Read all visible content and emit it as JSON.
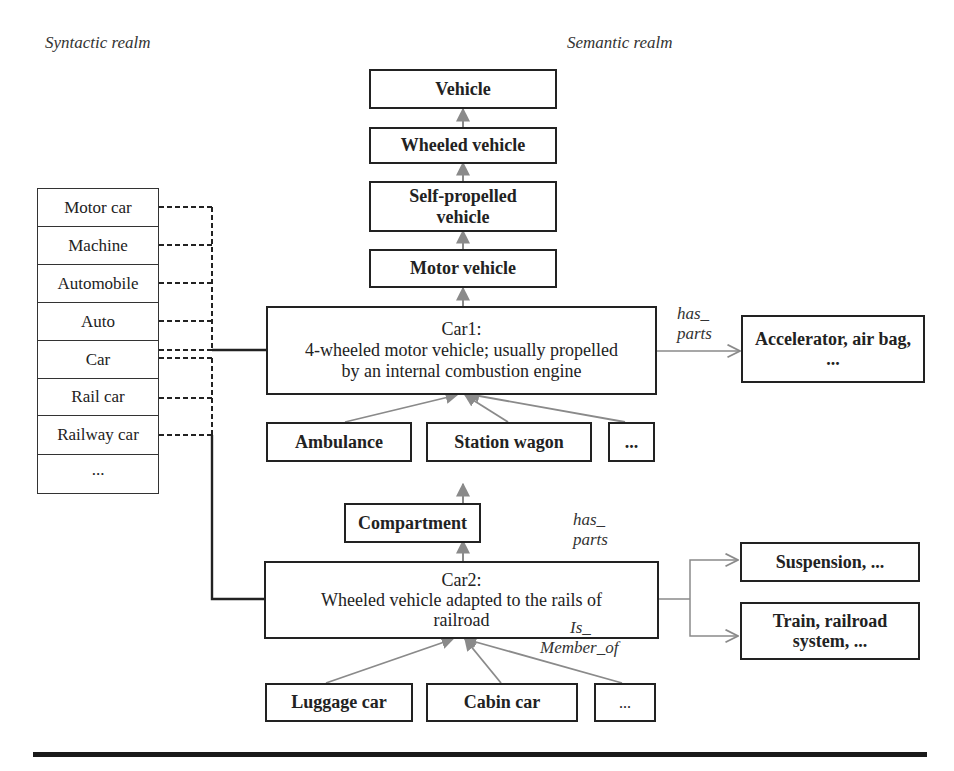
{
  "headers": {
    "syntactic": "Syntactic realm",
    "semantic": "Semantic realm"
  },
  "syntactic_terms": [
    "Motor car",
    "Machine",
    "Automobile",
    "Auto",
    "Car",
    "Rail car",
    "Railway car",
    "..."
  ],
  "hypernym_chain": [
    "Vehicle",
    "Wheeled vehicle",
    "Self-propelled vehicle",
    "Motor vehicle"
  ],
  "car1": {
    "title": "Car1:",
    "line1": "4-wheeled motor vehicle; usually propelled",
    "line2": "by an internal combustion engine",
    "hyponyms": [
      "Ambulance",
      "Station wagon",
      "..."
    ],
    "relation": {
      "line1": "has_",
      "line2": "parts"
    },
    "parts": "Accelerator, air bag, ..."
  },
  "car2": {
    "parent": "Compartment",
    "title": "Car2:",
    "line1": "Wheeled vehicle adapted to the rails of",
    "line2": "railroad",
    "hyponyms": [
      "Luggage car",
      "Cabin car",
      "..."
    ],
    "relation_parts": {
      "line1": "has_",
      "line2": "parts"
    },
    "parts": "Suspension, ...",
    "relation_member": {
      "line1": "Is_",
      "line2": "Member_of"
    },
    "member_of": "Train, railroad system, ..."
  },
  "colors": {
    "box_border": "#222222",
    "hierarchy_arrow": "#8a8a8a",
    "relation_arrow": "#8a8a8a",
    "synonym_link": "#222222"
  }
}
